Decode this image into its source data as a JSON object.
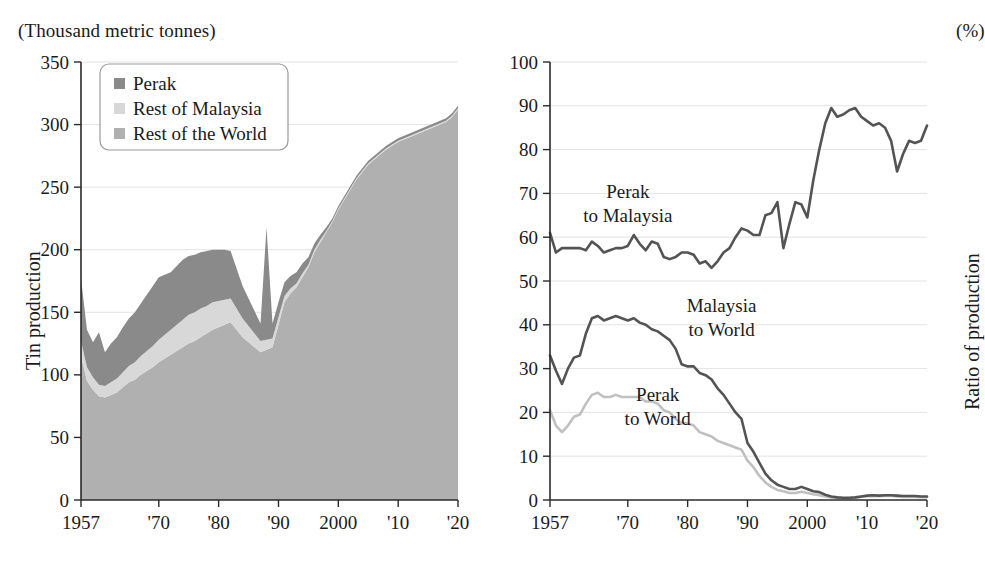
{
  "figure": {
    "background": "#ffffff",
    "panels": [
      "left",
      "right"
    ]
  },
  "left": {
    "unit_label": "(Thousand metric tonnes)",
    "y_axis_title": "Tin production",
    "legend": {
      "items": [
        {
          "label": "Perak",
          "color": "#8a8a8a"
        },
        {
          "label": "Rest of Malaysia",
          "color": "#d8d8d8"
        },
        {
          "label": "Rest of the World",
          "color": "#b0b0b0"
        }
      ]
    },
    "chart_data": {
      "type": "area",
      "title": "",
      "subtitle": "",
      "xlabel": "",
      "ylabel": "Tin production",
      "unit": "Thousand metric tonnes",
      "stacked": true,
      "grid": true,
      "legend_position": "top-left",
      "xlim": [
        1957,
        2020
      ],
      "ylim": [
        0,
        350
      ],
      "yticks": [
        0,
        50,
        100,
        150,
        200,
        250,
        300,
        350
      ],
      "xticks": [
        1957,
        1970,
        1980,
        1990,
        2000,
        2010,
        2020
      ],
      "xtick_labels": [
        "1957",
        "'70",
        "'80",
        "'90",
        "2000",
        "'10",
        "'20"
      ],
      "x": [
        1957,
        1958,
        1959,
        1960,
        1961,
        1962,
        1963,
        1964,
        1965,
        1966,
        1967,
        1968,
        1969,
        1970,
        1971,
        1972,
        1973,
        1974,
        1975,
        1976,
        1977,
        1978,
        1979,
        1980,
        1981,
        1982,
        1983,
        1984,
        1985,
        1986,
        1987,
        1988,
        1989,
        1990,
        1991,
        1992,
        1993,
        1994,
        1995,
        1996,
        1997,
        1998,
        1999,
        2000,
        2001,
        2002,
        2003,
        2004,
        2005,
        2006,
        2007,
        2008,
        2009,
        2010,
        2011,
        2012,
        2013,
        2014,
        2015,
        2016,
        2017,
        2018,
        2019,
        2020
      ],
      "series": [
        {
          "name": "Rest of the World",
          "color": "#b0b0b0",
          "stack_order": 1,
          "values": [
            115,
            95,
            88,
            83,
            82,
            84,
            86,
            90,
            94,
            96,
            100,
            103,
            106,
            110,
            113,
            116,
            119,
            122,
            125,
            127,
            130,
            133,
            136,
            138,
            140,
            142,
            136,
            130,
            126,
            122,
            118,
            120,
            122,
            140,
            158,
            165,
            170,
            178,
            186,
            198,
            206,
            214,
            222,
            232,
            240,
            248,
            256,
            262,
            268,
            272,
            276,
            280,
            283,
            286,
            288,
            290,
            292,
            294,
            296,
            298,
            300,
            302,
            306,
            312
          ]
        },
        {
          "name": "Rest of Malaysia",
          "color": "#d8d8d8",
          "stack_order": 2,
          "values": [
            12,
            11,
            10,
            9,
            9,
            10,
            11,
            12,
            13,
            14,
            15,
            16,
            17,
            18,
            19,
            20,
            21,
            22,
            23,
            23,
            23,
            22,
            22,
            21,
            20,
            19,
            17,
            15,
            13,
            11,
            9,
            8,
            7,
            6,
            5,
            4,
            3,
            3,
            2,
            2,
            2,
            1,
            1,
            1,
            1,
            1,
            1,
            1,
            1,
            1,
            1,
            1,
            1,
            1,
            1,
            1,
            1,
            1,
            1,
            1,
            1,
            1,
            1,
            1
          ]
        },
        {
          "name": "Perak",
          "color": "#8a8a8a",
          "stack_order": 3,
          "values": [
            50,
            30,
            28,
            42,
            27,
            31,
            33,
            36,
            38,
            40,
            42,
            45,
            48,
            50,
            48,
            46,
            47,
            48,
            47,
            46,
            45,
            44,
            42,
            41,
            40,
            38,
            32,
            26,
            22,
            18,
            14,
            90,
            12,
            12,
            11,
            10,
            9,
            8,
            6,
            5,
            4,
            3,
            2,
            2,
            2,
            2,
            2,
            2,
            2,
            2,
            2,
            2,
            2,
            2,
            2,
            2,
            2,
            2,
            2,
            2,
            2,
            2,
            2,
            2
          ]
        }
      ],
      "totals_note": "Total tin production peaks near 318 around 2005-2007 and again near 315 by 2020"
    }
  },
  "right": {
    "unit_label": "(%)",
    "y_axis_title": "Ratio of production",
    "annotations": [
      {
        "text_line1": "Perak",
        "text_line2": "to Malaysia"
      },
      {
        "text_line1": "Malaysia",
        "text_line2": "to World"
      },
      {
        "text_line1": "Perak",
        "text_line2": "to World"
      }
    ],
    "chart_data": {
      "type": "line",
      "title": "",
      "subtitle": "",
      "xlabel": "",
      "ylabel": "Ratio of production",
      "unit": "%",
      "grid": true,
      "legend_position": "in-plot annotations",
      "xlim": [
        1957,
        2020
      ],
      "ylim": [
        0,
        100
      ],
      "yticks": [
        0,
        10,
        20,
        30,
        40,
        50,
        60,
        70,
        80,
        90,
        100
      ],
      "xticks": [
        1957,
        1970,
        1980,
        1990,
        2000,
        2010,
        2020
      ],
      "xtick_labels": [
        "1957",
        "'70",
        "'80",
        "'90",
        "2000",
        "'10",
        "'20"
      ],
      "x": [
        1957,
        1958,
        1959,
        1960,
        1961,
        1962,
        1963,
        1964,
        1965,
        1966,
        1967,
        1968,
        1969,
        1970,
        1971,
        1972,
        1973,
        1974,
        1975,
        1976,
        1977,
        1978,
        1979,
        1980,
        1981,
        1982,
        1983,
        1984,
        1985,
        1986,
        1987,
        1988,
        1989,
        1990,
        1991,
        1992,
        1993,
        1994,
        1995,
        1996,
        1997,
        1998,
        1999,
        2000,
        2001,
        2002,
        2003,
        2004,
        2005,
        2006,
        2007,
        2008,
        2009,
        2010,
        2011,
        2012,
        2013,
        2014,
        2015,
        2016,
        2017,
        2018,
        2019,
        2020
      ],
      "series": [
        {
          "name": "Perak to Malaysia",
          "color": "#545454",
          "values": [
            61,
            56.5,
            57.5,
            57.5,
            57.5,
            57.5,
            57,
            59,
            58,
            56.5,
            57,
            57.5,
            57.5,
            58,
            60.5,
            58.5,
            57,
            59,
            58.5,
            55.5,
            55,
            55.5,
            56.5,
            56.5,
            56,
            54,
            54.5,
            53,
            54.5,
            56.5,
            57.5,
            60,
            62,
            61.5,
            60.5,
            60.5,
            65,
            65.5,
            68,
            57.5,
            63,
            68,
            67.5,
            64.5,
            73,
            80,
            86,
            89.5,
            87.5,
            88,
            89,
            89.5,
            87.5,
            86.5,
            85.5,
            86,
            85,
            82,
            75,
            79,
            82,
            81.5,
            82,
            85.5
          ]
        },
        {
          "name": "Malaysia to World",
          "color": "#545454",
          "values": [
            33,
            29.5,
            26.5,
            30,
            32.5,
            33,
            38,
            41.5,
            42,
            41,
            41.5,
            42,
            41.5,
            41,
            41.5,
            40.5,
            40,
            39,
            38.5,
            37.5,
            36.5,
            34.5,
            31,
            30.5,
            30.5,
            29,
            28.5,
            27.5,
            25.5,
            24,
            22,
            20,
            18.5,
            13,
            11,
            8.5,
            6,
            4.5,
            3.5,
            3,
            2.5,
            2.5,
            3,
            2.5,
            2,
            1.8,
            1.2,
            0.8,
            0.6,
            0.5,
            0.5,
            0.6,
            0.8,
            1,
            1.1,
            1,
            1.1,
            1.1,
            1,
            0.9,
            0.9,
            0.9,
            0.8,
            0.8
          ]
        },
        {
          "name": "Perak to World",
          "color": "#c0c0c0",
          "values": [
            20.5,
            17,
            15.5,
            17,
            19,
            19.5,
            22,
            24,
            24.5,
            23.5,
            23.5,
            24,
            23.5,
            23.5,
            23.5,
            23.5,
            22.5,
            22.5,
            22,
            20.5,
            20,
            18.5,
            17.5,
            17.5,
            17,
            15.5,
            15,
            14.5,
            13.5,
            13,
            12.5,
            12,
            11.5,
            9,
            7.5,
            5.5,
            4,
            3,
            2.3,
            2,
            1.6,
            1.6,
            1.9,
            1.6,
            1.3,
            1.1,
            0.8,
            0.6,
            0.5,
            0.4,
            0.4,
            0.5,
            0.7,
            0.85,
            0.9,
            0.85,
            0.9,
            0.9,
            0.8,
            0.7,
            0.7,
            0.7,
            0.65,
            0.65
          ]
        }
      ]
    }
  }
}
